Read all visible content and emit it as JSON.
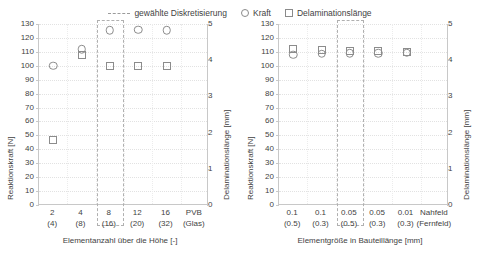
{
  "legend": {
    "items": [
      {
        "label": "gewählte Diskretisierung",
        "marker": "dashed-box-icon"
      },
      {
        "label": "Kraft",
        "marker": "circle-icon"
      },
      {
        "label": "Delaminationslänge",
        "marker": "square-icon"
      }
    ]
  },
  "chart_data": [
    {
      "type": "scatter",
      "panel": "left",
      "title": "",
      "xlabel": "Elementanzahl über die Höhe [-]",
      "ylabel": "Reaktionskraft [N]",
      "y2label": "Delaminationslänge [mm]",
      "categories": [
        "2",
        "4",
        "8",
        "12",
        "16",
        "PVB"
      ],
      "categories_sub": [
        "(4)",
        "(8)",
        "(16)",
        "(20)",
        "(32)",
        "(Glas)"
      ],
      "ylim": [
        0,
        130
      ],
      "yticks": [
        0,
        10,
        20,
        30,
        40,
        50,
        60,
        70,
        80,
        90,
        100,
        110,
        120,
        130
      ],
      "y2lim": [
        0,
        5
      ],
      "y2ticks": [
        0,
        1,
        2,
        3,
        4,
        5
      ],
      "grid": true,
      "highlight_category": "8",
      "series": [
        {
          "name": "Kraft",
          "marker": "circle",
          "axis": "y",
          "values": [
            100,
            112,
            125.5,
            126,
            125.5,
            null
          ]
        },
        {
          "name": "Delaminationslänge",
          "marker": "square",
          "axis": "y2",
          "values": [
            1.8,
            4.15,
            3.85,
            3.85,
            3.85,
            null
          ]
        }
      ]
    },
    {
      "type": "scatter",
      "panel": "right",
      "title": "",
      "xlabel": "Elementgröße in Bauteillänge [mm]",
      "ylabel": "Reaktionskraft [N]",
      "y2label": "Delaminationslänge [mm]",
      "categories": [
        "0.1",
        "0.1",
        "0.05",
        "0.05",
        "0.01",
        "Nahfeld"
      ],
      "categories_sub": [
        "(0.5)",
        "(0.3)",
        "(0.5)",
        "(0.3)",
        "(0.3)",
        "(Fernfeld)"
      ],
      "ylim": [
        0,
        130
      ],
      "yticks": [
        0,
        10,
        20,
        30,
        40,
        50,
        60,
        70,
        80,
        90,
        100,
        110,
        120,
        130
      ],
      "y2lim": [
        0,
        5
      ],
      "y2ticks": [
        0,
        1,
        2,
        3,
        4,
        5
      ],
      "grid": true,
      "highlight_category": "0.05",
      "series": [
        {
          "name": "Kraft",
          "marker": "circle",
          "axis": "y",
          "values": [
            108,
            108.5,
            109,
            109,
            109.5,
            null
          ]
        },
        {
          "name": "Delaminationslänge",
          "marker": "square",
          "axis": "y2",
          "values": [
            4.3,
            4.28,
            4.25,
            4.25,
            4.22,
            null
          ]
        }
      ]
    }
  ],
  "colors": {
    "marker": "#8c8c8c",
    "axis": "#c8c8c8",
    "grid": "#e2e2e2",
    "highlight": "#b0b0b0",
    "text": "#3f3f3f"
  }
}
